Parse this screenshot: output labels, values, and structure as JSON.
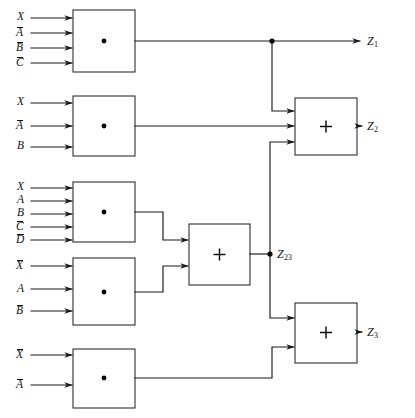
{
  "diagram": {
    "kind": "block-diagram",
    "colors": {
      "background": "#ffffff",
      "line": "#1a1a1a",
      "text": "#111111",
      "box_fill": "#ffffff"
    },
    "symbols": {
      "and_symbol": "·",
      "or_symbol": "+"
    },
    "gates": [
      {
        "id": "and1",
        "type": "and",
        "symbol": "·",
        "inputs": [
          {
            "base": "X",
            "bar": false,
            "text": "X"
          },
          {
            "base": "A",
            "bar": true,
            "text": "Ā"
          },
          {
            "base": "B",
            "bar": true,
            "text": "B̄"
          },
          {
            "base": "C",
            "bar": true,
            "text": "C̄"
          }
        ],
        "output": "Z1"
      },
      {
        "id": "and2",
        "type": "and",
        "symbol": "·",
        "inputs": [
          {
            "base": "X",
            "bar": false,
            "text": "X"
          },
          {
            "base": "A",
            "bar": true,
            "text": "Ā"
          },
          {
            "base": "B",
            "bar": false,
            "text": "B"
          }
        ],
        "output": "to-or-Z2"
      },
      {
        "id": "and3",
        "type": "and",
        "symbol": "·",
        "inputs": [
          {
            "base": "X",
            "bar": false,
            "text": "X"
          },
          {
            "base": "A",
            "bar": false,
            "text": "A"
          },
          {
            "base": "B",
            "bar": false,
            "text": "B"
          },
          {
            "base": "C",
            "bar": true,
            "text": "C̄"
          },
          {
            "base": "D",
            "bar": true,
            "text": "D̄"
          }
        ],
        "output": "to-or-Z23"
      },
      {
        "id": "and4",
        "type": "and",
        "symbol": "·",
        "inputs": [
          {
            "base": "X",
            "bar": true,
            "text": "X̄"
          },
          {
            "base": "A",
            "bar": false,
            "text": "A"
          },
          {
            "base": "B",
            "bar": true,
            "text": "B̄"
          }
        ],
        "output": "to-or-Z23"
      },
      {
        "id": "and5",
        "type": "and",
        "symbol": "·",
        "inputs": [
          {
            "base": "X",
            "bar": true,
            "text": "X̄"
          },
          {
            "base": "A",
            "bar": true,
            "text": "Ā"
          }
        ],
        "output": "to-or-Z3"
      },
      {
        "id": "or23",
        "type": "or",
        "symbol": "+",
        "inputs": [
          "and3",
          "and4"
        ],
        "output": "Z23"
      },
      {
        "id": "or2",
        "type": "or",
        "symbol": "+",
        "inputs": [
          "Z1",
          "and2",
          "Z23"
        ],
        "output": "Z2"
      },
      {
        "id": "or3",
        "type": "or",
        "symbol": "+",
        "inputs": [
          "Z23",
          "and5"
        ],
        "output": "Z3"
      }
    ],
    "input_labels": [
      {
        "id": "in-1-1",
        "text": "X",
        "base": "X",
        "bar": false,
        "x": 17,
        "y": 14
      },
      {
        "id": "in-1-2",
        "text": "Ā",
        "base": "A",
        "bar": true,
        "x": 17,
        "y": 29
      },
      {
        "id": "in-1-3",
        "text": "B̄",
        "base": "B",
        "bar": true,
        "x": 17,
        "y": 44
      },
      {
        "id": "in-1-4",
        "text": "C̄",
        "base": "C",
        "bar": true,
        "x": 17,
        "y": 59
      },
      {
        "id": "in-2-1",
        "text": "X",
        "base": "X",
        "bar": false,
        "x": 17,
        "y": 99
      },
      {
        "id": "in-2-2",
        "text": "Ā",
        "base": "A",
        "bar": true,
        "x": 17,
        "y": 120
      },
      {
        "id": "in-2-3",
        "text": "B",
        "base": "B",
        "bar": false,
        "x": 17,
        "y": 142
      },
      {
        "id": "in-3-1",
        "text": "X",
        "base": "X",
        "bar": false,
        "x": 17,
        "y": 184
      },
      {
        "id": "in-3-2",
        "text": "A",
        "base": "A",
        "bar": false,
        "x": 17,
        "y": 197
      },
      {
        "id": "in-3-3",
        "text": "B",
        "base": "B",
        "bar": false,
        "x": 17,
        "y": 210
      },
      {
        "id": "in-3-4",
        "text": "C̄",
        "base": "C",
        "bar": true,
        "x": 17,
        "y": 224
      },
      {
        "id": "in-3-5",
        "text": "D̄",
        "base": "D",
        "bar": true,
        "x": 17,
        "y": 238
      },
      {
        "id": "in-4-1",
        "text": "X̄",
        "base": "X",
        "bar": true,
        "x": 17,
        "y": 262
      },
      {
        "id": "in-4-2",
        "text": "A",
        "base": "A",
        "bar": false,
        "x": 17,
        "y": 285
      },
      {
        "id": "in-4-3",
        "text": "B̄",
        "base": "B",
        "bar": true,
        "x": 17,
        "y": 307
      },
      {
        "id": "in-5-1",
        "text": "X̄",
        "base": "X",
        "bar": true,
        "x": 17,
        "y": 351
      },
      {
        "id": "in-5-2",
        "text": "Ā",
        "base": "A",
        "bar": true,
        "x": 17,
        "y": 381
      }
    ],
    "output_labels": [
      {
        "id": "out-z1",
        "base": "Z",
        "sub": "1",
        "x": 367,
        "y": 35
      },
      {
        "id": "out-z2",
        "base": "Z",
        "sub": "2",
        "x": 367,
        "y": 122
      },
      {
        "id": "out-z3",
        "base": "Z",
        "sub": "3",
        "x": 367,
        "y": 330
      },
      {
        "id": "out-z23",
        "base": "Z",
        "sub": "23",
        "x": 276,
        "y": 245
      }
    ],
    "junction_nodes": [
      {
        "id": "node-z1",
        "x": 272,
        "y": 41
      },
      {
        "id": "node-z23",
        "x": 270,
        "y": 250
      }
    ]
  }
}
